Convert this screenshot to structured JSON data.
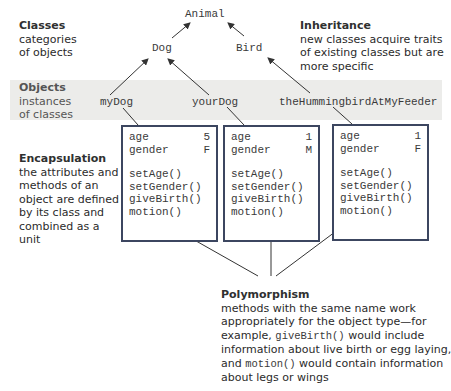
{
  "classes": {
    "title": "Classes",
    "desc_lines": [
      "categories",
      "of objects"
    ],
    "nodes": {
      "root": "Animal",
      "left": "Dog",
      "right": "Bird"
    }
  },
  "inheritance": {
    "title": "Inheritance",
    "desc_lines": [
      "new classes acquire traits",
      "of existing classes but are",
      "more specific"
    ]
  },
  "objects": {
    "title": "Objects",
    "desc_lines": [
      "instances",
      "of classes"
    ],
    "names": [
      "myDog",
      "yourDog",
      "theHummingbirdAtMyFeeder"
    ]
  },
  "encapsulation": {
    "title": "Encapsulation",
    "desc_lines": [
      "the attributes and",
      "methods of an",
      "object are defined",
      "by its class and",
      "combined as a",
      "unit"
    ]
  },
  "object_boxes": [
    {
      "attributes": [
        {
          "name": "age",
          "value": "5"
        },
        {
          "name": "gender",
          "value": "F"
        }
      ],
      "methods": [
        "setAge()",
        "setGender()",
        "giveBirth()",
        "motion()"
      ]
    },
    {
      "attributes": [
        {
          "name": "age",
          "value": "1"
        },
        {
          "name": "gender",
          "value": "M"
        }
      ],
      "methods": [
        "setAge()",
        "setGender()",
        "giveBirth()",
        "motion()"
      ]
    },
    {
      "attributes": [
        {
          "name": "age",
          "value": "1"
        },
        {
          "name": "gender",
          "value": "F"
        }
      ],
      "methods": [
        "setAge()",
        "setGender()",
        "giveBirth()",
        "motion()"
      ]
    }
  ],
  "polymorphism": {
    "title": "Polymorphism",
    "line1": "methods with the same name work",
    "line2": "appropriately for the object type—for",
    "line3_pre": "example, ",
    "line3_code": "giveBirth()",
    "line3_post": " would include",
    "line4": "information about live birth or egg laying,",
    "line5_pre": "and ",
    "line5_code": "motion()",
    "line5_post": " would contain information",
    "line6": "about legs or wings"
  },
  "colors": {
    "box_border": "#3c4660",
    "band": "#ececea",
    "arrow": "#333333"
  }
}
